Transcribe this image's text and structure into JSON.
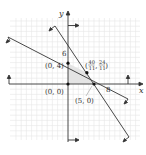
{
  "diagram": {
    "type": "linear-programming-feasible-region",
    "axes": {
      "x_label": "x",
      "y_label": "y"
    },
    "ticks": {
      "y_tick": "6",
      "x_tick": "8"
    },
    "vertices": [
      {
        "label": "(0, 0)",
        "x": 0,
        "y": 0
      },
      {
        "label": "(0, 4)",
        "x": 0,
        "y": 4
      },
      {
        "label": "(5, 0)",
        "x": 5,
        "y": 0
      },
      {
        "label_num_x": "40",
        "label_den_x": "11",
        "label_num_y": "24",
        "label_den_y": "11",
        "x": 3.636,
        "y": 2.182
      }
    ],
    "lines": [
      {
        "name": "boundary-1",
        "equation": "x + 2y = 8"
      },
      {
        "name": "boundary-2",
        "equation": "8x + 5y = 40"
      }
    ],
    "colors": {
      "line": "#333333",
      "grid": "#e6e6e6",
      "region": "#e8e8e8"
    }
  }
}
